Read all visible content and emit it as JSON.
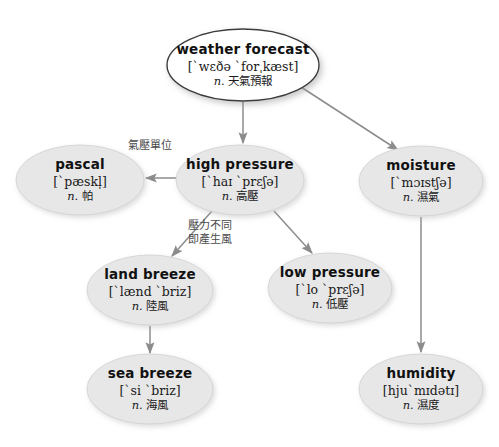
{
  "diagram": {
    "colors": {
      "root_fill": "#ffffff",
      "node_fill": "#e7e7e7",
      "node_stroke": "#d0d0d0",
      "root_stroke": "#3a3a3a",
      "arrow": "#8c8c8c",
      "text": "#111111",
      "label_text": "#4a4a4a",
      "background": "#ffffff"
    },
    "nodes": [
      {
        "id": "weather-forecast",
        "term": "weather forecast",
        "ipa": "[ˋwɛðə ˋforˌkæst]",
        "pos": "n.",
        "gloss": "天氣預報",
        "cx": 243,
        "cy": 65,
        "rx": 76,
        "ry": 36,
        "style": "root"
      },
      {
        "id": "pascal",
        "term": "pascal",
        "ipa": "[ˋpæskl̩]",
        "pos": "n.",
        "gloss": "帕",
        "cx": 80,
        "cy": 180,
        "rx": 64,
        "ry": 35,
        "style": "normal"
      },
      {
        "id": "high-pressure",
        "term": "high pressure",
        "ipa": "[ˋhaɪ ˋprɛʃə]",
        "pos": "n.",
        "gloss": "高壓",
        "cx": 240,
        "cy": 180,
        "rx": 64,
        "ry": 35,
        "style": "normal"
      },
      {
        "id": "moisture",
        "term": "moisture",
        "ipa": "[ˋmɔɪstʃə]",
        "pos": "n.",
        "gloss": "濕氣",
        "cx": 421,
        "cy": 181,
        "rx": 62,
        "ry": 35,
        "style": "normal"
      },
      {
        "id": "land-breeze",
        "term": "land breeze",
        "ipa": "[ˋlænd ˋbriz]",
        "pos": "n.",
        "gloss": "陸風",
        "cx": 150,
        "cy": 290,
        "rx": 63,
        "ry": 35,
        "style": "normal"
      },
      {
        "id": "low-pressure",
        "term": "low pressure",
        "ipa": "[ˋlo ˋprɛʃə]",
        "pos": "n.",
        "gloss": "低壓",
        "cx": 330,
        "cy": 288,
        "rx": 62,
        "ry": 35,
        "style": "normal"
      },
      {
        "id": "sea-breeze",
        "term": "sea breeze",
        "ipa": "[ˋsi ˋbriz]",
        "pos": "n.",
        "gloss": "海風",
        "cx": 150,
        "cy": 389,
        "rx": 63,
        "ry": 35,
        "style": "normal"
      },
      {
        "id": "humidity",
        "term": "humidity",
        "ipa": "[hjuˋmɪdətɪ]",
        "pos": "n.",
        "gloss": "濕度",
        "cx": 421,
        "cy": 389,
        "rx": 62,
        "ry": 35,
        "style": "normal"
      }
    ],
    "edges": [
      {
        "id": "edge-forecast-high",
        "from": "weather-forecast",
        "to": "high-pressure",
        "x1": 243,
        "y1": 101,
        "x2": 243,
        "y2": 143,
        "label": ""
      },
      {
        "id": "edge-forecast-moisture",
        "from": "weather-forecast",
        "to": "moisture",
        "x1": 301,
        "y1": 87,
        "x2": 398,
        "y2": 150,
        "label": ""
      },
      {
        "id": "edge-high-pascal",
        "from": "high-pressure",
        "to": "pascal",
        "x1": 176,
        "y1": 178,
        "x2": 146,
        "y2": 178,
        "label": "氣壓單位"
      },
      {
        "id": "edge-high-land",
        "from": "high-pressure",
        "to": "land-breeze",
        "x1": 212,
        "y1": 211,
        "x2": 172,
        "y2": 256,
        "label": "壓力不同\n即產生風"
      },
      {
        "id": "edge-high-low",
        "from": "high-pressure",
        "to": "low-pressure",
        "x1": 274,
        "y1": 211,
        "x2": 312,
        "y2": 253,
        "label": ""
      },
      {
        "id": "edge-land-sea",
        "from": "land-breeze",
        "to": "sea-breeze",
        "x1": 150,
        "y1": 326,
        "x2": 150,
        "y2": 353,
        "label": ""
      },
      {
        "id": "edge-moisture-humidity",
        "from": "moisture",
        "to": "humidity",
        "x1": 421,
        "y1": 217,
        "x2": 421,
        "y2": 352,
        "label": ""
      }
    ],
    "edge_labels": [
      {
        "id": "label-pressure-unit",
        "lines": [
          "氣壓單位"
        ],
        "x": 128,
        "y": 139
      },
      {
        "id": "label-wind-generation",
        "lines": [
          "壓力不同",
          "即產生風"
        ],
        "x": 188,
        "y": 219
      }
    ]
  }
}
